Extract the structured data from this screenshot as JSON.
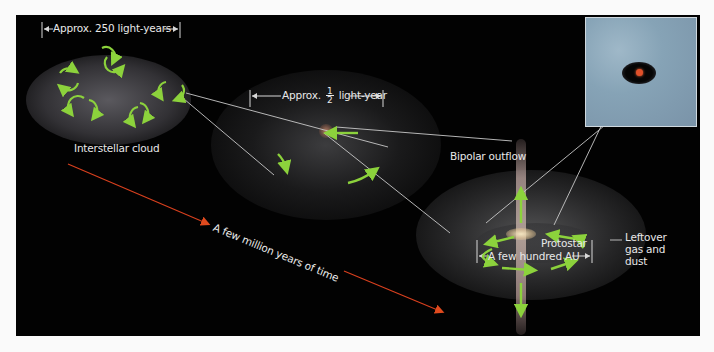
{
  "figure": {
    "panels": [
      {
        "id": "interstellar-cloud",
        "label": "Interstellar cloud",
        "scale": "Approx. 250 light-years"
      },
      {
        "id": "collapsing-core",
        "scale_prefix": "Approx.",
        "scale_fraction_num": "1",
        "scale_fraction_den": "2",
        "scale_suffix": "light-year"
      },
      {
        "id": "protostar-system",
        "labels": {
          "outflow": "Bipolar outflow",
          "protostar": "Protostar",
          "leftover_line1": "Leftover",
          "leftover_line2": "gas and",
          "leftover_line3": "dust"
        },
        "scale": "A few hundred AU"
      }
    ],
    "time_arrow": {
      "label": "A few million years of time",
      "color": "#d8401e"
    },
    "colors": {
      "background": "#020202",
      "rotation_arrows": "#8cd23c",
      "connector_lines": "#cfcfcf",
      "inset_bg": "#8aa6ba",
      "protostar_core": "#e0502a"
    }
  }
}
